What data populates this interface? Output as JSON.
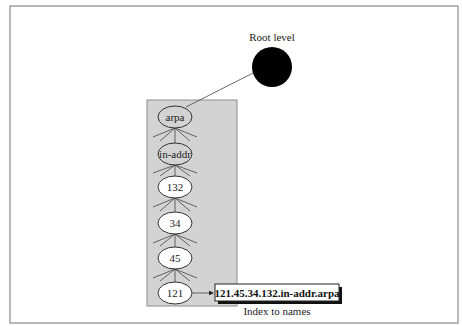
{
  "diagram": {
    "root": {
      "label": "Root level",
      "cx": 272,
      "cy": 67,
      "r": 20,
      "color": "#000000"
    },
    "domain_box": {
      "x": 147,
      "y": 100,
      "w": 90,
      "h": 206,
      "color": "#d3d3d3"
    },
    "nodes": [
      {
        "label": "arpa",
        "cx": 175,
        "cy": 117,
        "fill": "gray"
      },
      {
        "label": "in-addr",
        "cx": 175,
        "cy": 154,
        "fill": "gray"
      },
      {
        "label": "132",
        "cx": 175,
        "cy": 187,
        "fill": "white"
      },
      {
        "label": "34",
        "cx": 175,
        "cy": 223,
        "fill": "white"
      },
      {
        "label": "45",
        "cx": 175,
        "cy": 258,
        "fill": "white"
      },
      {
        "label": "121",
        "cx": 175,
        "cy": 293,
        "fill": "white"
      }
    ],
    "result": {
      "label": "121.45.34.132.in-addr.arpa",
      "caption": "Index to names"
    }
  }
}
